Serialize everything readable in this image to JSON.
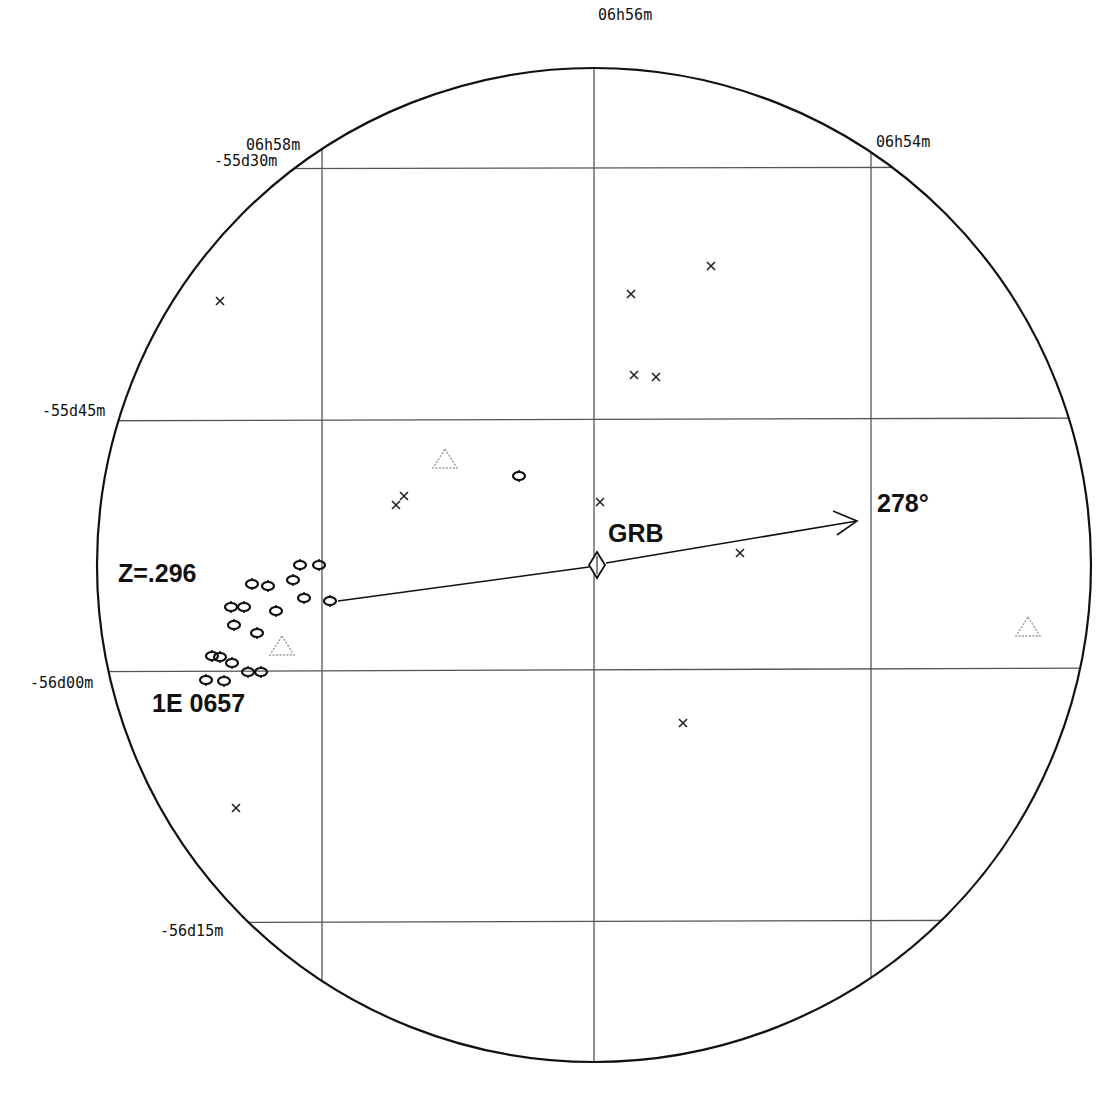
{
  "chart_data": {
    "type": "scatter",
    "projection": "circular field of view, RA/Dec grid",
    "circle": {
      "cx": 594,
      "cy": 565,
      "r": 497
    },
    "ra_labels": [
      {
        "text": "06h58m",
        "x": 320
      },
      {
        "text": "06h56m",
        "x": 594
      },
      {
        "text": "06h54m",
        "x": 871
      }
    ],
    "dec_labels": [
      {
        "text": "-55d30m",
        "y": 169
      },
      {
        "text": "-55d45m",
        "y": 421
      },
      {
        "text": "-56d00m",
        "y": 671
      },
      {
        "text": "-56d15m",
        "y": 923
      }
    ],
    "annotations": {
      "grb_label": "GRB",
      "angle_label": "278°",
      "redshift_label": "Z=.296",
      "cluster_label": "1E 0657"
    },
    "grb_marker": {
      "x": 597,
      "y": 565,
      "symbol": "diamond"
    },
    "arrow": {
      "from": [
        597,
        565
      ],
      "to": [
        858,
        520
      ],
      "position_angle_deg": 278
    },
    "link_line": {
      "from": [
        335,
        601
      ],
      "to": [
        589,
        567
      ]
    },
    "series": [
      {
        "name": "x-sources",
        "symbol": "cross",
        "points": [
          [
            220,
            301
          ],
          [
            631,
            294
          ],
          [
            711,
            266
          ],
          [
            634,
            375
          ],
          [
            656,
            377
          ],
          [
            396,
            505
          ],
          [
            404,
            496
          ],
          [
            600,
            502
          ],
          [
            740,
            553
          ],
          [
            683,
            723
          ],
          [
            236,
            808
          ]
        ]
      },
      {
        "name": "triangle-sources",
        "symbol": "triangle",
        "points": [
          [
            445,
            460
          ],
          [
            282,
            647
          ],
          [
            1028,
            628
          ]
        ]
      },
      {
        "name": "cluster-galaxies",
        "symbol": "ellipse",
        "points": [
          [
            519,
            476
          ],
          [
            300,
            565
          ],
          [
            319,
            565
          ],
          [
            293,
            580
          ],
          [
            304,
            598
          ],
          [
            330,
            601
          ],
          [
            252,
            584
          ],
          [
            268,
            586
          ],
          [
            231,
            607
          ],
          [
            244,
            607
          ],
          [
            276,
            611
          ],
          [
            234,
            625
          ],
          [
            257,
            633
          ],
          [
            220,
            657
          ],
          [
            212,
            656
          ],
          [
            232,
            663
          ],
          [
            206,
            680
          ],
          [
            224,
            681
          ],
          [
            248,
            672
          ],
          [
            261,
            672
          ]
        ]
      }
    ],
    "grid": true,
    "xlabel": "Right Ascension",
    "ylabel": "Declination"
  }
}
